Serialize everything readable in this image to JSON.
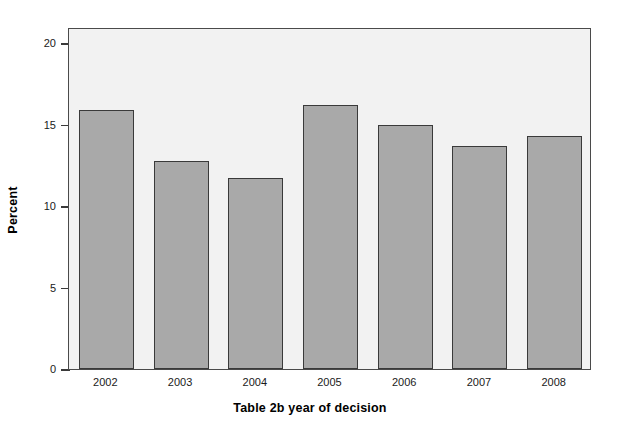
{
  "chart_data": {
    "type": "bar",
    "title": "",
    "xlabel": "Table 2b year of decision",
    "ylabel": "Percent",
    "categories": [
      "2002",
      "2003",
      "2004",
      "2005",
      "2006",
      "2007",
      "2008"
    ],
    "values": [
      15.9,
      12.8,
      11.7,
      16.2,
      15.0,
      13.7,
      14.3
    ],
    "ylim": [
      0,
      21
    ],
    "yticks": [
      0,
      5,
      10,
      15,
      20
    ],
    "ytick_labels": [
      "0",
      "5",
      "10",
      "15",
      "20"
    ],
    "grid": false,
    "legend": "none",
    "bar_fill_color": "#a9a9a9",
    "bar_edge_color": "#3a3a3a",
    "plot_background_color": "#f2f2f2",
    "frame_color": "#4a4a4a"
  }
}
